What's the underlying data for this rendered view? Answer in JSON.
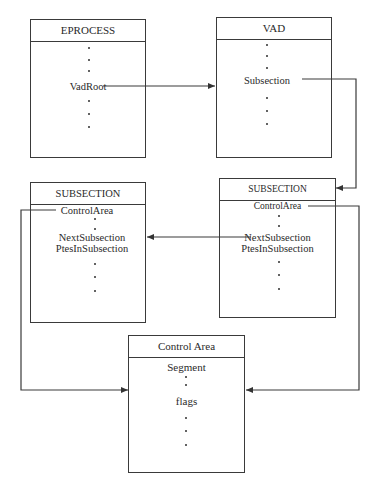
{
  "diagram": {
    "boxes": {
      "eprocess": {
        "title": "EPROCESS",
        "fields": [
          "VadRoot"
        ]
      },
      "vad": {
        "title": "VAD",
        "fields": [
          "Subsection"
        ]
      },
      "subsection_left": {
        "title": "SUBSECTION",
        "fields": [
          "ControlArea",
          "NextSubsection",
          "PtesInSubsection"
        ]
      },
      "subsection_right": {
        "title": "SUBSECTION",
        "fields": [
          "ControlArea",
          "NextSubsection",
          "PtesInSubsection"
        ]
      },
      "control_area": {
        "title": "Control Area",
        "fields": [
          "Segment",
          "flags"
        ]
      }
    },
    "edges": [
      {
        "from": "eprocess.VadRoot",
        "to": "vad"
      },
      {
        "from": "vad.Subsection",
        "to": "subsection_right"
      },
      {
        "from": "subsection_right.NextSubsection",
        "to": "subsection_left.NextSubsection"
      },
      {
        "from": "subsection_left.ControlArea",
        "to": "control_area"
      },
      {
        "from": "subsection_right.ControlArea",
        "to": "control_area"
      }
    ],
    "colors": {
      "line": "#3a3a3a",
      "background": "#ffffff"
    }
  }
}
